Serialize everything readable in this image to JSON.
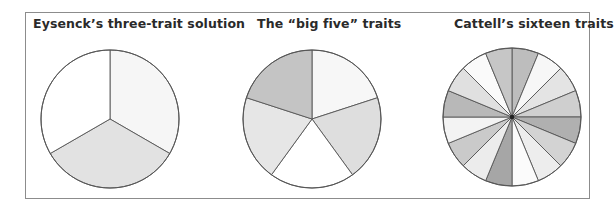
{
  "chart_data": [
    {
      "type": "pie",
      "title": "Eysenck’s three-trait solution",
      "values": [
        1,
        1,
        1
      ],
      "start_angle_deg": 0,
      "direction": "clockwise",
      "colors": [
        "#f6f6f6",
        "#e2e2e2",
        "#ffffff"
      ],
      "center": [
        110,
        119
      ],
      "radius": 69
    },
    {
      "type": "pie",
      "title": "The “big five” traits",
      "values": [
        1,
        1,
        1,
        1,
        1
      ],
      "start_angle_deg": 0,
      "direction": "clockwise",
      "colors": [
        "#f7f7f7",
        "#dedede",
        "#ffffff",
        "#e6e6e6",
        "#c4c4c4"
      ],
      "center": [
        312,
        119
      ],
      "radius": 69
    },
    {
      "type": "pie",
      "title": "Cattell’s sixteen traits",
      "values": [
        1,
        1,
        1,
        1,
        1,
        1,
        1,
        1,
        1,
        1,
        1,
        1,
        1,
        1,
        1,
        1
      ],
      "start_angle_deg": 0,
      "direction": "clockwise",
      "colors": [
        "#bdbdbd",
        "#f7f7f7",
        "#e4e4e4",
        "#cfcfcf",
        "#b0b0b0",
        "#d3d3d3",
        "#ededed",
        "#fbfbfb",
        "#a6a6a6",
        "#ececec",
        "#cacaca",
        "#f3f3f3",
        "#b8b8b8",
        "#e0e0e0",
        "#fafafa",
        "#c6c6c6"
      ],
      "center": [
        512,
        117
      ],
      "radius": 69
    }
  ],
  "stroke_color": "#555555",
  "frame_color": "#8c8c8c"
}
